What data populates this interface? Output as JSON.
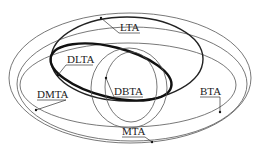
{
  "diagram": {
    "type": "nested-ellipse-venn",
    "labels": {
      "lta": "LTA",
      "dlta": "DLTA",
      "dbta": "DBTA",
      "dmta": "DMTA",
      "bta": "BTA",
      "mta": "MTA"
    },
    "regions": [
      {
        "id": "MTA",
        "emphasis": "thin",
        "contains": [
          "LTA",
          "BTA",
          "DMTA",
          "DLTA",
          "DBTA"
        ]
      },
      {
        "id": "LTA",
        "emphasis": "medium"
      },
      {
        "id": "DLTA",
        "emphasis": "thick"
      },
      {
        "id": "BTA",
        "emphasis": "thin"
      },
      {
        "id": "DBTA",
        "emphasis": "thin"
      },
      {
        "id": "DMTA",
        "emphasis": "thin"
      }
    ],
    "colors": {
      "stroke": "#222222",
      "background": "#ffffff"
    }
  }
}
